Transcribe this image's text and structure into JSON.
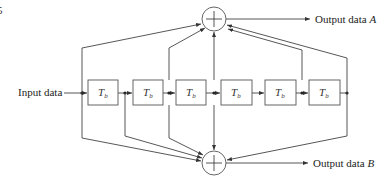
{
  "diagram": {
    "type": "tapped-delay-line encoder",
    "corner_fragment": "5",
    "input_label": "Input data",
    "output_a": {
      "text": "Output data ",
      "var": "A"
    },
    "output_b": {
      "text": "Output data ",
      "var": "B"
    },
    "delay_label": {
      "main": "T",
      "sub": "b"
    },
    "delay_count": 6,
    "adders": [
      {
        "id": "top",
        "symbol": "+"
      },
      {
        "id": "bottom",
        "symbol": "+"
      }
    ]
  }
}
